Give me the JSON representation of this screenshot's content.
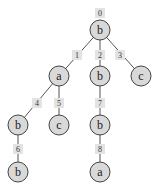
{
  "diagram": {
    "type": "tree",
    "colors": {
      "node_fill": "#d9d9d9",
      "node_stroke": "#444444",
      "label_box": "#e3e3e3",
      "edge": "#555555"
    },
    "nodes": [
      {
        "id": 0,
        "label": "b",
        "index_label": "0",
        "x": 100,
        "y": 30
      },
      {
        "id": 1,
        "label": "a",
        "index_label": "1",
        "x": 59,
        "y": 76
      },
      {
        "id": 2,
        "label": "b",
        "index_label": "2",
        "x": 100,
        "y": 76
      },
      {
        "id": 3,
        "label": "c",
        "index_label": "3",
        "x": 141,
        "y": 76
      },
      {
        "id": 4,
        "label": "b",
        "index_label": "4",
        "x": 18,
        "y": 125
      },
      {
        "id": 5,
        "label": "c",
        "index_label": "5",
        "x": 59,
        "y": 125
      },
      {
        "id": 6,
        "label": "b",
        "index_label": "6",
        "x": 18,
        "y": 172
      },
      {
        "id": 7,
        "label": "b",
        "index_label": "7",
        "x": 100,
        "y": 125
      },
      {
        "id": 8,
        "label": "a",
        "index_label": "8",
        "x": 100,
        "y": 172
      }
    ],
    "edges": [
      {
        "from": 0,
        "to": 1
      },
      {
        "from": 0,
        "to": 2
      },
      {
        "from": 0,
        "to": 3
      },
      {
        "from": 1,
        "to": 4
      },
      {
        "from": 1,
        "to": 5
      },
      {
        "from": 4,
        "to": 6
      },
      {
        "from": 2,
        "to": 7
      },
      {
        "from": 7,
        "to": 8
      }
    ],
    "index_label_positions": [
      {
        "x": 100,
        "y": 13
      },
      {
        "x": 77,
        "y": 55
      },
      {
        "x": 100,
        "y": 55
      },
      {
        "x": 120,
        "y": 55
      },
      {
        "x": 37,
        "y": 103
      },
      {
        "x": 59,
        "y": 103
      },
      {
        "x": 18,
        "y": 149
      },
      {
        "x": 100,
        "y": 103
      },
      {
        "x": 100,
        "y": 149
      }
    ]
  }
}
